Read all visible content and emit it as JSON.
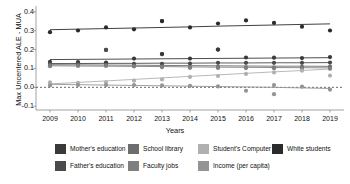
{
  "chart_data": {
    "type": "line",
    "title": "",
    "xlabel": "Years",
    "ylabel": "Max Uncentered ALE - MUA",
    "x": [
      2009,
      2010,
      2011,
      2012,
      2013,
      2014,
      2015,
      2016,
      2017,
      2018,
      2019
    ],
    "xtick_labels": [
      "2009",
      "2010",
      "2011",
      "2012",
      "2013",
      "2014",
      "2015",
      "2016",
      "2017",
      "2018",
      "2019"
    ],
    "ytick_labels": [
      "0.4",
      "0.3",
      "0.2",
      "0.1",
      "0.0",
      "-0.1"
    ],
    "ytick_values": [
      0.4,
      0.3,
      0.2,
      0.1,
      0.0,
      -0.1
    ],
    "ylim": [
      -0.12,
      0.42
    ],
    "xlim": [
      2008.5,
      2019.5
    ],
    "grid": false,
    "zero_reference_line": 0.0,
    "legend_position": "bottom",
    "marker": "circle",
    "series": [
      {
        "name": "White students",
        "color": "#2b2b2b",
        "values": [
          0.292,
          0.301,
          0.317,
          0.307,
          0.351,
          0.317,
          0.338,
          0.354,
          0.341,
          0.321,
          0.301
        ],
        "trend": [
          0.305,
          0.308,
          0.311,
          0.314,
          0.317,
          0.32,
          0.324,
          0.327,
          0.33,
          0.333,
          0.336
        ]
      },
      {
        "name": "Mother's education",
        "color": "#3a3a3a",
        "values": [
          0.135,
          0.133,
          0.131,
          0.152,
          0.176,
          0.152,
          0.2,
          0.158,
          0.157,
          0.155,
          0.16
        ],
        "trend": [
          0.147,
          0.148,
          0.149,
          0.15,
          0.151,
          0.152,
          0.153,
          0.154,
          0.155,
          0.156,
          0.157
        ]
      },
      {
        "name": "Father's education",
        "color": "#4a4a4a",
        "values": [
          0.125,
          0.124,
          0.198,
          0.124,
          0.124,
          0.126,
          0.13,
          0.13,
          0.13,
          0.13,
          0.131
        ],
        "trend": [
          0.126,
          0.126,
          0.127,
          0.127,
          0.128,
          0.128,
          0.129,
          0.129,
          0.13,
          0.13,
          0.131
        ]
      },
      {
        "name": "School library",
        "color": "#6d6d6d",
        "values": [
          0.118,
          0.118,
          0.118,
          0.112,
          0.107,
          0.105,
          0.108,
          0.106,
          0.105,
          0.108,
          0.11
        ],
        "trend": [
          0.12,
          0.119,
          0.118,
          0.117,
          0.116,
          0.115,
          0.114,
          0.113,
          0.112,
          0.112,
          0.111
        ]
      },
      {
        "name": "Faculty jobs",
        "color": "#7f7f7f",
        "values": [
          0.112,
          0.113,
          0.113,
          0.111,
          0.11,
          0.104,
          0.103,
          0.102,
          0.101,
          0.1,
          0.099
        ],
        "trend": [
          0.114,
          0.113,
          0.112,
          0.111,
          0.11,
          0.108,
          0.107,
          0.106,
          0.105,
          0.104,
          0.103
        ]
      },
      {
        "name": "Student's Computer",
        "color": "#b0b0b0",
        "values": [
          0.026,
          0.024,
          0.026,
          0.035,
          0.042,
          0.055,
          0.06,
          0.071,
          0.079,
          0.088,
          0.062
        ],
        "trend": [
          0.018,
          0.026,
          0.034,
          0.042,
          0.05,
          0.058,
          0.066,
          0.074,
          0.082,
          0.089,
          0.097
        ]
      },
      {
        "name": "Income (per capita)",
        "color": "#949494",
        "values": [
          0.01,
          0.012,
          0.012,
          0.012,
          0.01,
          0.008,
          0.005,
          -0.018,
          0.012,
          0.004,
          -0.012
        ],
        "trend": [
          0.016,
          0.014,
          0.012,
          0.01,
          0.008,
          0.006,
          0.004,
          0.002,
          0.0,
          -0.003,
          -0.006
        ]
      }
    ],
    "outliers": [
      {
        "series": "Father's education",
        "x": 2011,
        "y": 0.198
      },
      {
        "series": "Mother's education",
        "x": 2015,
        "y": 0.2
      },
      {
        "series": "Mother's education",
        "x": 2013,
        "y": 0.176
      },
      {
        "series": "White students",
        "x": 2013,
        "y": 0.351
      },
      {
        "series": "Income (per capita)",
        "x": 2017,
        "y": -0.036
      }
    ]
  },
  "legend": {
    "rows": [
      [
        {
          "label": "Mother's education",
          "color": "#3a3a3a"
        },
        {
          "label": "School library",
          "color": "#6d6d6d"
        },
        {
          "label": "Student's Computer",
          "color": "#b0b0b0"
        },
        {
          "label": "White students",
          "color": "#2b2b2b"
        }
      ],
      [
        {
          "label": "Father's education",
          "color": "#4a4a4a"
        },
        {
          "label": "Faculty jobs",
          "color": "#7f7f7f"
        },
        {
          "label": "Income (per capita)",
          "color": "#949494"
        }
      ]
    ]
  }
}
